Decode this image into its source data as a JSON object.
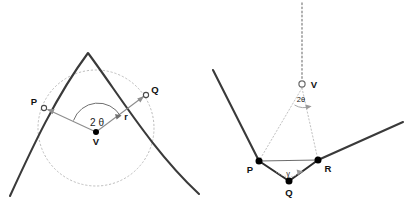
{
  "figure": {
    "title": "",
    "background_color": "#ffffff",
    "width": 416,
    "height": 208,
    "colors": {
      "curve": "#3a3a3a",
      "dotted": "#b9b9b9",
      "ray": "#8a8a8a",
      "marker_fill": "#000000",
      "marker_open": "#ffffff",
      "label": "#111111"
    }
  },
  "left_panel": {
    "name": "parabola-with-inscribed-circle",
    "labels": {
      "point_p": "P",
      "point_q": "Q",
      "vertex_v": "V",
      "angle": "2 θ",
      "radius": "r"
    },
    "points": {
      "P": {
        "x": 44,
        "y": 108
      },
      "Q": {
        "x": 146,
        "y": 95
      },
      "V": {
        "x": 96,
        "y": 132
      }
    },
    "circle": {
      "cx": 96,
      "cy": 128,
      "r": 58,
      "style": "dotted"
    },
    "parabola": {
      "apex_x": 88,
      "apex_y": 53,
      "x_start": 10,
      "x_end": 199
    },
    "angle_value_deg": 0
  },
  "right_panel": {
    "name": "vee-reflection-geometry",
    "labels": {
      "point_p": "P",
      "point_q": "Q",
      "point_r": "R",
      "vertex_v": "V",
      "angle_v": "2θ",
      "angle_q": "γ"
    },
    "points": {
      "P": {
        "x": 259,
        "y": 161
      },
      "Q": {
        "x": 289,
        "y": 181
      },
      "R": {
        "x": 318,
        "y": 160
      },
      "V": {
        "x": 302,
        "y": 84
      }
    },
    "axis": {
      "x": 302,
      "y_top": 3,
      "y_bottom": 80,
      "style": "dotted"
    },
    "left_ray": {
      "x1": 213,
      "y1": 70,
      "x2": 259,
      "y2": 161
    },
    "right_ray": {
      "x1": 318,
      "y1": 160,
      "x2": 403,
      "y2": 122
    }
  }
}
